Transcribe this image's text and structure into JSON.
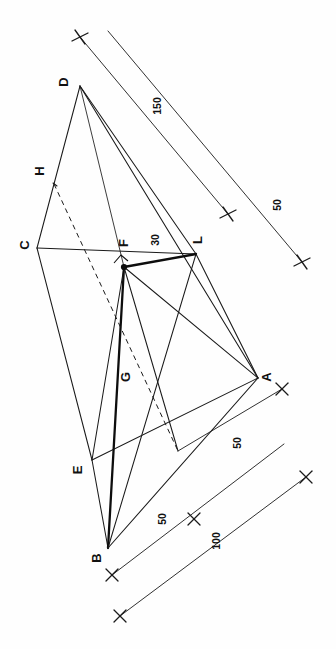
{
  "figure": {
    "orientation_degrees": 90,
    "background_color": "#ffffff",
    "ink_color": "#1a1a1a"
  },
  "vertices": [
    {
      "id": "D",
      "label": "D",
      "x": 72,
      "y": 82
    },
    {
      "id": "H",
      "label": "H",
      "x": 44,
      "y": 170
    },
    {
      "id": "C",
      "label": "C",
      "x": 29,
      "y": 245
    },
    {
      "id": "F",
      "label": "F",
      "x": 124,
      "y": 258
    },
    {
      "id": "L",
      "label": "L",
      "x": 198,
      "y": 245
    },
    {
      "id": "A",
      "label": "A",
      "x": 263,
      "y": 378
    },
    {
      "id": "G",
      "label": "G",
      "x": 127,
      "y": 377
    },
    {
      "id": "E",
      "label": "E",
      "x": 84,
      "y": 466
    },
    {
      "id": "B",
      "label": "B",
      "x": 101,
      "y": 554
    }
  ],
  "dimensions": [
    {
      "id": "dim-150",
      "value": "150"
    },
    {
      "id": "dim-50-right",
      "value": "50"
    },
    {
      "id": "dim-30",
      "value": "30"
    },
    {
      "id": "dim-50-lower-inner",
      "value": "50"
    },
    {
      "id": "dim-50-lower-mid",
      "value": "50"
    },
    {
      "id": "dim-100-lower-outer",
      "value": "100"
    }
  ],
  "markers": {
    "right_angle_at": "F",
    "node_dot_at": "F",
    "dashed_construction_line": "H-to-lower-right"
  }
}
